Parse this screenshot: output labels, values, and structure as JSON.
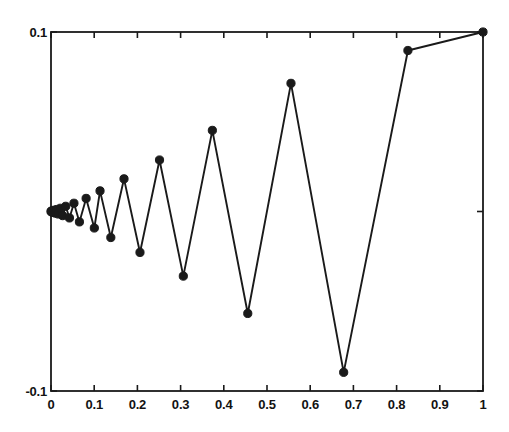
{
  "chart_data": {
    "type": "line",
    "title": "",
    "xlabel": "",
    "ylabel": "",
    "xlim": [
      0,
      1
    ],
    "ylim": [
      -0.1,
      0.1
    ],
    "grid": false,
    "legend": null,
    "marker": "filled-circle",
    "line_color": "#1a1a1a",
    "marker_color": "#1a1a1a",
    "xticks": [
      0,
      0.1,
      0.2,
      0.3,
      0.4,
      0.5,
      0.6,
      0.7,
      0.8,
      0.9,
      1
    ],
    "xticklabels": [
      "0",
      "0.1",
      "0.2",
      "0.3",
      "0.4",
      "0.5",
      "0.6",
      "0.7",
      "0.8",
      "0.9",
      "1"
    ],
    "yticks": [
      -0.1,
      0,
      0.1
    ],
    "yticklabels": [
      "-0.1",
      "",
      "0.1"
    ],
    "ytick_labels_shown": [
      "0.1",
      "-0.1"
    ],
    "series": [
      {
        "name": "oscillating-sequence",
        "x": [
          0,
          0.0008,
          0.0018,
          0.0031,
          0.0048,
          0.0069,
          0.0095,
          0.0127,
          0.0166,
          0.0213,
          0.0271,
          0.0341,
          0.0427,
          0.0531,
          0.0658,
          0.0813,
          0.1003,
          0.1135,
          0.1385,
          0.169,
          0.206,
          0.2512,
          0.3063,
          0.3735,
          0.4555,
          0.5555,
          0.6775,
          0.8262,
          1.0
        ],
        "y": [
          0,
          0.0002,
          -0.0003,
          0.0004,
          -0.0005,
          0.0007,
          -0.0009,
          0.0011,
          -0.0014,
          0.0018,
          -0.0023,
          0.0029,
          -0.0036,
          0.0046,
          -0.0058,
          0.0073,
          -0.0092,
          0.0115,
          -0.0145,
          0.0182,
          -0.0228,
          0.0287,
          -0.036,
          0.0452,
          -0.0568,
          0.0714,
          -0.0896,
          0.0897,
          0.1
        ]
      }
    ]
  },
  "axes": {
    "box_color": "#1a1a1a",
    "background": "#ffffff"
  }
}
